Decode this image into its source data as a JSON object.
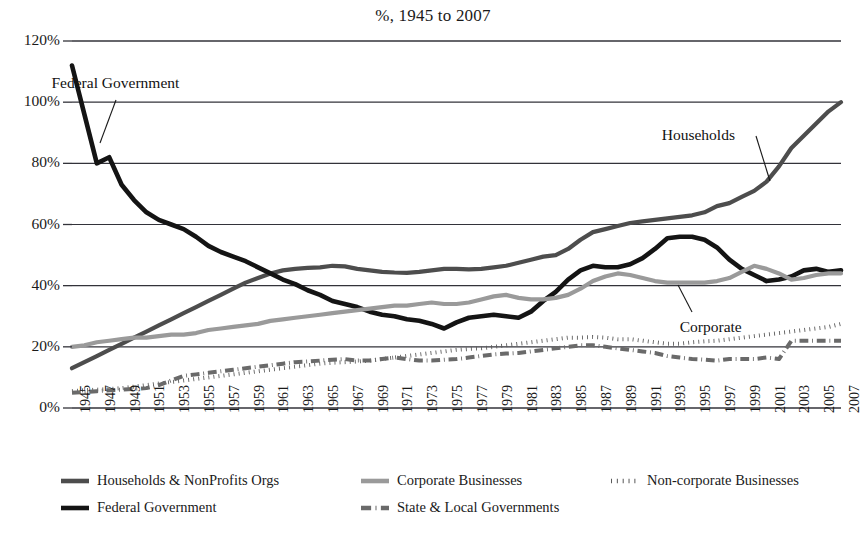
{
  "chart_data": {
    "type": "line",
    "title": "%, 1945 to 2007",
    "xlabel": "",
    "ylabel": "",
    "ylim": [
      0,
      120
    ],
    "ytick_values": [
      0,
      20,
      40,
      60,
      80,
      100,
      120
    ],
    "ytick_labels": [
      "0%",
      "20%",
      "40%",
      "60%",
      "80%",
      "100%",
      "120%"
    ],
    "grid": true,
    "legend_position": "bottom",
    "x": [
      1945,
      1946,
      1947,
      1948,
      1949,
      1950,
      1951,
      1952,
      1953,
      1954,
      1955,
      1956,
      1957,
      1958,
      1959,
      1960,
      1961,
      1962,
      1963,
      1964,
      1965,
      1966,
      1967,
      1968,
      1969,
      1970,
      1971,
      1972,
      1973,
      1974,
      1975,
      1976,
      1977,
      1978,
      1979,
      1980,
      1981,
      1982,
      1983,
      1984,
      1985,
      1986,
      1987,
      1988,
      1989,
      1990,
      1991,
      1992,
      1993,
      1994,
      1995,
      1996,
      1997,
      1998,
      1999,
      2000,
      2001,
      2002,
      2003,
      2004,
      2005,
      2006,
      2007
    ],
    "xtick_labels": [
      "1945",
      "1947",
      "1949",
      "1951",
      "1953",
      "1955",
      "1957",
      "1959",
      "1961",
      "1963",
      "1965",
      "1967",
      "1969",
      "1971",
      "1973",
      "1975",
      "1977",
      "1979",
      "1981",
      "1983",
      "1985",
      "1987",
      "1989",
      "1991",
      "1993",
      "1995",
      "1997",
      "1999",
      "2001",
      "2003",
      "2005",
      "2007"
    ],
    "series": [
      {
        "name": "Households & NonProfits Orgs",
        "short_name": "Households",
        "color": "#4d4d4d",
        "style": "solid",
        "width": 4.2,
        "values": [
          13,
          15,
          17,
          19,
          21,
          23,
          25,
          27,
          29,
          31,
          33,
          35,
          37,
          39,
          41,
          42.5,
          44,
          45,
          45.5,
          45.8,
          46,
          46.5,
          46.3,
          45.5,
          45,
          44.5,
          44.3,
          44.2,
          44.5,
          45,
          45.5,
          45.5,
          45.3,
          45.5,
          46,
          46.5,
          47.5,
          48.5,
          49.5,
          50,
          52,
          55,
          57.5,
          58.5,
          59.5,
          60.5,
          61,
          61.5,
          62,
          62.5,
          63,
          64,
          66,
          67,
          69,
          71,
          74,
          79,
          85,
          89,
          93,
          97,
          100
        ]
      },
      {
        "name": "Federal Government",
        "short_name": "Federal Government",
        "color": "#141414",
        "style": "solid",
        "width": 4.6,
        "values": [
          112,
          96,
          80,
          82,
          73,
          68,
          64,
          61.5,
          60,
          58.5,
          56,
          53,
          51,
          49.5,
          48,
          46,
          44,
          42,
          40.5,
          38.5,
          37,
          35,
          34,
          33,
          31.5,
          30.5,
          30,
          29,
          28.5,
          27.5,
          26,
          28,
          29.5,
          30,
          30.5,
          30,
          29.5,
          31.5,
          35,
          38,
          42,
          45,
          46.5,
          46,
          46,
          47,
          49,
          52,
          55.5,
          56,
          56,
          55,
          52.5,
          48.5,
          45.5,
          43.5,
          41.5,
          42,
          43,
          45,
          45.5,
          44.5,
          45
        ]
      },
      {
        "name": "Corporate Businesses",
        "short_name": "Corporate",
        "color": "#9a9a9a",
        "style": "solid",
        "width": 4.2,
        "values": [
          20,
          20.5,
          21.5,
          22,
          22.5,
          23,
          23,
          23.5,
          24,
          24,
          24.5,
          25.5,
          26,
          26.5,
          27,
          27.5,
          28.5,
          29,
          29.5,
          30,
          30.5,
          31,
          31.5,
          32,
          32.5,
          33,
          33.5,
          33.5,
          34,
          34.5,
          34,
          34,
          34.5,
          35.5,
          36.5,
          37,
          36,
          35.5,
          35.5,
          36,
          37,
          39,
          41.5,
          43,
          44,
          43.5,
          42.5,
          41.5,
          41,
          41,
          41,
          41,
          41.5,
          42.5,
          44.5,
          46.5,
          45.5,
          44,
          42,
          42.5,
          43.5,
          44,
          44
        ]
      },
      {
        "name": "Non-corporate Businesses",
        "short_name": "Non-corporate",
        "color": "#5a5a5a",
        "style": "dotted",
        "width": 4,
        "values": [
          5.5,
          5.8,
          6,
          6.2,
          6.5,
          7,
          7.5,
          8,
          8.5,
          9,
          9.5,
          10,
          10.5,
          11,
          11.5,
          12,
          12.5,
          13,
          13.5,
          14,
          14.5,
          14.8,
          15,
          15.2,
          15.5,
          16,
          16.5,
          17,
          17.5,
          18,
          18.5,
          19,
          19.3,
          19.5,
          20,
          20.5,
          21,
          21.5,
          22,
          22.5,
          23,
          23,
          23.2,
          23,
          22.5,
          22.5,
          22,
          21.5,
          21,
          21,
          21.5,
          21.8,
          22,
          22.5,
          23,
          23.5,
          24,
          24.5,
          25,
          25.5,
          26,
          26.5,
          27.5
        ]
      },
      {
        "name": "State & Local Governments",
        "short_name": "State & Local",
        "color": "#6a6a6a",
        "style": "dashdot",
        "width": 4,
        "values": [
          5,
          5.2,
          5.5,
          5.8,
          6,
          6.2,
          6.5,
          7.5,
          9,
          10.5,
          11,
          11.5,
          12,
          12.5,
          13,
          13.5,
          14,
          14.5,
          15,
          15.2,
          15.5,
          15.8,
          16,
          15.5,
          15.5,
          16,
          16.5,
          16,
          15.5,
          15.5,
          15.8,
          16,
          16.5,
          17,
          17.5,
          17.8,
          18,
          18.5,
          19,
          19.5,
          20,
          20.5,
          20.5,
          20,
          19.5,
          19,
          18.5,
          18,
          17,
          16.5,
          16,
          15.8,
          15.5,
          16,
          16,
          16,
          16.5,
          16,
          22,
          22,
          22,
          22,
          22
        ]
      }
    ],
    "annotations": [
      {
        "text": "Federal Government",
        "x": 1948.5,
        "y": 106
      },
      {
        "text": "Households",
        "x": 1995.5,
        "y": 89
      },
      {
        "text": "Corporate",
        "x": 1996.5,
        "y": 26
      }
    ]
  },
  "legend": {
    "items": [
      {
        "label": "Households & NonProfits Orgs",
        "style": "solid",
        "color": "#4d4d4d"
      },
      {
        "label": "Federal Government",
        "style": "solid",
        "color": "#141414"
      },
      {
        "label": "Corporate Businesses",
        "style": "solid",
        "color": "#9a9a9a"
      },
      {
        "label": "State & Local Governments",
        "style": "dashdot",
        "color": "#6a6a6a"
      },
      {
        "label": "Non-corporate Businesses",
        "style": "dotted",
        "color": "#5a5a5a"
      }
    ]
  }
}
